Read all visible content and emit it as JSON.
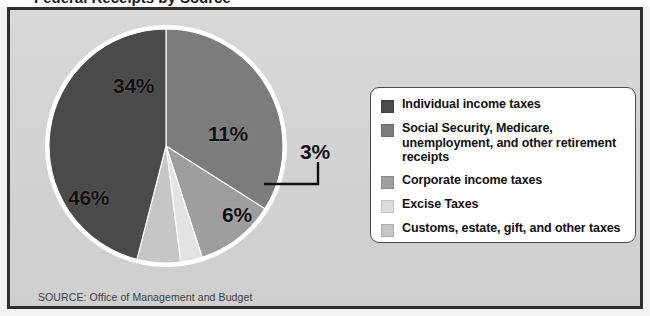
{
  "figure": {
    "title_clipped": "Federal Receipts by Source",
    "source_note": "SOURCE: Office of Management and Budget"
  },
  "colors": {
    "panel_bg": "#d6d6d6",
    "frame_border": "#2e2e2e",
    "legend_bg": "#ffffff",
    "legend_border": "#4a4a4a",
    "label_text": "#111111",
    "source_text": "#3d3d3d",
    "slice_outline": "#ffffff"
  },
  "chart_data": {
    "type": "pie",
    "title": "Federal Receipts by Source",
    "xlabel": "",
    "ylabel": "",
    "grid": false,
    "legend_position": "right",
    "start_angle_deg": 0,
    "direction": "clockwise",
    "units": "percent",
    "total": 100,
    "categories": [
      "Social Security, Medicare, unemployment, and other retirement receipts",
      "Corporate income taxes",
      "Customs, estate, gift, and other taxes",
      "Excise Taxes",
      "Individual income taxes"
    ],
    "values": [
      34,
      11,
      3,
      6,
      46
    ],
    "labels": [
      "34%",
      "11%",
      "3%",
      "6%",
      "46%"
    ],
    "slice_colors": [
      "#7c7c7c",
      "#9e9e9e",
      "#e3e3e3",
      "#c6c6c6",
      "#4a4a4a"
    ]
  },
  "legend": {
    "items": [
      {
        "label": "Individual income taxes",
        "color": "#4a4a4a",
        "value": 46
      },
      {
        "label": "Social Security, Medicare, unemployment, and other retirement receipts",
        "color": "#7c7c7c",
        "value": 34
      },
      {
        "label": "Corporate income taxes",
        "color": "#9e9e9e",
        "value": 11
      },
      {
        "label": "Excise Taxes",
        "color": "#dddddd",
        "value": 6
      },
      {
        "label": "Customs, estate, gift, and other taxes",
        "color": "#c6c6c6",
        "value": 3
      }
    ]
  },
  "callout": {
    "label": "3%",
    "for_category": "Customs, estate, gift, and other taxes"
  }
}
